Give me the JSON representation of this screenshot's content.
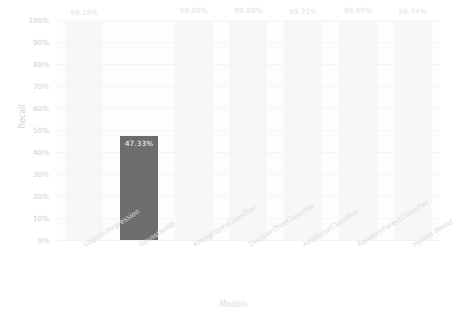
{
  "chart_data": {
    "type": "bar",
    "title": "",
    "xlabel": "Models",
    "ylabel": "Recall",
    "categories": [
      "LogisticRegression",
      "GaussianNB",
      "KNeighborsClassifier",
      "DecisionTreeClassifier",
      "AdaBoostClassifier",
      "RandomForestClassifier",
      "Hybrid Model"
    ],
    "values": [
      99.19,
      47.33,
      99.89,
      99.86,
      99.72,
      99.9,
      99.74
    ],
    "value_labels": [
      "99.19%",
      "47.33%",
      "99.89%",
      "99.86%",
      "99.72%",
      "99.90%",
      "99.74%"
    ],
    "ylim": [
      0,
      100
    ],
    "ytick_labels": [
      "0%",
      "10%",
      "20%",
      "30%",
      "40%",
      "50%",
      "60%",
      "70%",
      "80%",
      "90%",
      "100%"
    ],
    "ytick_values": [
      0,
      10,
      20,
      30,
      40,
      50,
      60,
      70,
      80,
      90,
      100
    ],
    "grid": true,
    "legend": "none",
    "highlight_index": 1,
    "colors": {
      "bar_default": "#f7f7f7",
      "bar_highlight": "#6d6d6d",
      "plot_background": "#fdfdfd",
      "gridline": "#f4f4f4",
      "tick_text": "#cfcfcf",
      "value_text": "#e2e2e2",
      "value_text_highlight": "#ffffff"
    }
  }
}
